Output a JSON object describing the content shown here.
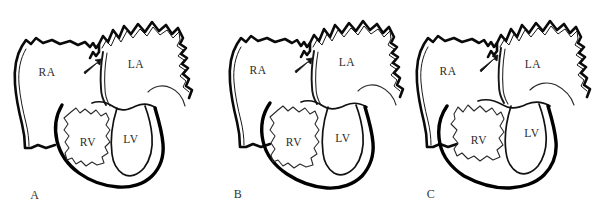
{
  "figure": {
    "background_color": "#ffffff",
    "line_color": "#000000",
    "label_color": "#2b2b2b",
    "panel_count": 3
  },
  "panels": [
    {
      "letter": "A",
      "chambers": {
        "right_atrium": "RA",
        "left_atrium": "LA",
        "right_ventricle": "RV",
        "left_ventricle": "LV"
      },
      "annotation": {
        "marker": "arrow",
        "name": "septum-arrow",
        "points_to": "interatrial septum"
      }
    },
    {
      "letter": "B",
      "chambers": {
        "right_atrium": "RA",
        "left_atrium": "LA",
        "right_ventricle": "RV",
        "left_ventricle": "LV"
      },
      "annotation": {
        "marker": "arrow",
        "name": "septum-arrow",
        "points_to": "interatrial septum"
      }
    },
    {
      "letter": "C",
      "chambers": {
        "right_atrium": "RA",
        "left_atrium": "LA",
        "right_ventricle": "RV",
        "left_ventricle": "LV"
      },
      "annotation": {
        "marker": "arrow",
        "name": "septum-arrow",
        "points_to": "interatrial septum"
      }
    }
  ]
}
